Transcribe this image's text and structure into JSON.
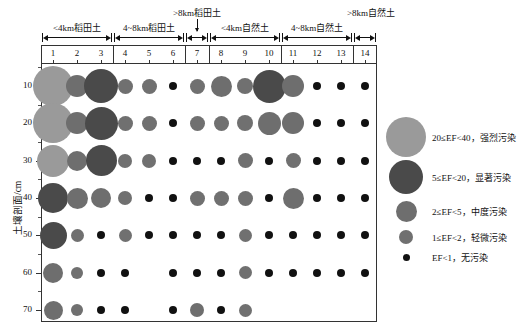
{
  "figure": {
    "y_axis_title": "土壤剖面/cm",
    "y_ticks": [
      "10",
      "20",
      "30",
      "40",
      "50",
      "60",
      "70"
    ],
    "column_numbers": [
      "1",
      "2",
      "3",
      "4",
      "5",
      "6",
      "7",
      "8",
      "9",
      "10",
      "11",
      "12",
      "13",
      "14"
    ],
    "groups": [
      {
        "label": "<4km稻田土",
        "from": 1,
        "to": 3
      },
      {
        "label": "4~8km稻田土",
        "from": 4,
        "to": 6
      },
      {
        "label": ">8km稻田土",
        "from": 7,
        "to": 7
      },
      {
        "label": "<4km自然土",
        "from": 8,
        "to": 10
      },
      {
        "label": "4~8km自然土",
        "from": 11,
        "to": 13
      },
      {
        "label": ">8km自然土",
        "from": 14,
        "to": 14
      }
    ]
  },
  "legend": {
    "items": [
      {
        "label": "20≤EF<40，强烈污染",
        "size": 40,
        "color": "#9a9a9a"
      },
      {
        "label": "5≤EF<20，显著污染",
        "size": 34,
        "color": "#4a4a4a"
      },
      {
        "label": "2≤EF<5，中度污染",
        "size": 21,
        "color": "#6e6e6e"
      },
      {
        "label": "1≤EF<2，轻微污染",
        "size": 14,
        "color": "#707070"
      },
      {
        "label": "EF<1，无污染",
        "size": 7,
        "color": "#111111"
      }
    ]
  },
  "chart_data": {
    "type": "scatter",
    "title": "",
    "xlabel": "",
    "ylabel": "土壤剖面/cm",
    "x": [
      1,
      2,
      3,
      4,
      5,
      6,
      7,
      8,
      9,
      10,
      11,
      12,
      13,
      14
    ],
    "y": [
      10,
      20,
      30,
      40,
      50,
      60,
      70
    ],
    "ylim": [
      5,
      75
    ],
    "grid": false,
    "legend_position": "right",
    "size_encoding": "bubble area = enrichment factor (EF) class",
    "classes": [
      {
        "name": "强烈污染",
        "range": "20≤EF<40",
        "size": 40,
        "color": "#9a9a9a"
      },
      {
        "name": "显著污染",
        "range": "5≤EF<20",
        "size": 34,
        "color": "#4a4a4a"
      },
      {
        "name": "中度污染",
        "range": "2≤EF<5",
        "size": 21,
        "color": "#6e6e6e"
      },
      {
        "name": "轻微污染",
        "range": "1≤EF<2",
        "size": 14,
        "color": "#707070"
      },
      {
        "name": "无污染",
        "range": "EF<1",
        "size": 7,
        "color": "#111111"
      }
    ],
    "points": [
      {
        "col": 1,
        "depth": 10,
        "size": 40,
        "color": "#9a9a9a",
        "class": "强烈污染"
      },
      {
        "col": 2,
        "depth": 10,
        "size": 22,
        "color": "#6e6e6e",
        "class": "中度污染"
      },
      {
        "col": 3,
        "depth": 10,
        "size": 34,
        "color": "#4a4a4a",
        "class": "显著污染"
      },
      {
        "col": 4,
        "depth": 10,
        "size": 15,
        "color": "#707070",
        "class": "轻微污染"
      },
      {
        "col": 5,
        "depth": 10,
        "size": 15,
        "color": "#707070",
        "class": "轻微污染"
      },
      {
        "col": 6,
        "depth": 10,
        "size": 8,
        "color": "#111111",
        "class": "无污染"
      },
      {
        "col": 7,
        "depth": 10,
        "size": 15,
        "color": "#707070",
        "class": "轻微污染"
      },
      {
        "col": 8,
        "depth": 10,
        "size": 21,
        "color": "#6e6e6e",
        "class": "中度污染"
      },
      {
        "col": 9,
        "depth": 10,
        "size": 16,
        "color": "#707070",
        "class": "轻微污染"
      },
      {
        "col": 10,
        "depth": 10,
        "size": 33,
        "color": "#4a4a4a",
        "class": "显著污染"
      },
      {
        "col": 11,
        "depth": 10,
        "size": 22,
        "color": "#6e6e6e",
        "class": "中度污染"
      },
      {
        "col": 12,
        "depth": 10,
        "size": 8,
        "color": "#111111",
        "class": "无污染"
      },
      {
        "col": 13,
        "depth": 10,
        "size": 8,
        "color": "#111111",
        "class": "无污染"
      },
      {
        "col": 14,
        "depth": 10,
        "size": 8,
        "color": "#111111",
        "class": "无污染"
      },
      {
        "col": 1,
        "depth": 20,
        "size": 40,
        "color": "#9a9a9a",
        "class": "强烈污染"
      },
      {
        "col": 2,
        "depth": 20,
        "size": 22,
        "color": "#6e6e6e",
        "class": "中度污染"
      },
      {
        "col": 3,
        "depth": 20,
        "size": 33,
        "color": "#4a4a4a",
        "class": "显著污染"
      },
      {
        "col": 4,
        "depth": 20,
        "size": 15,
        "color": "#707070",
        "class": "轻微污染"
      },
      {
        "col": 5,
        "depth": 20,
        "size": 15,
        "color": "#707070",
        "class": "轻微污染"
      },
      {
        "col": 6,
        "depth": 20,
        "size": 8,
        "color": "#111111",
        "class": "无污染"
      },
      {
        "col": 7,
        "depth": 20,
        "size": 15,
        "color": "#707070",
        "class": "轻微污染"
      },
      {
        "col": 8,
        "depth": 20,
        "size": 15,
        "color": "#707070",
        "class": "轻微污染"
      },
      {
        "col": 9,
        "depth": 20,
        "size": 16,
        "color": "#707070",
        "class": "轻微污染"
      },
      {
        "col": 10,
        "depth": 20,
        "size": 23,
        "color": "#6e6e6e",
        "class": "中度污染"
      },
      {
        "col": 11,
        "depth": 20,
        "size": 22,
        "color": "#6e6e6e",
        "class": "中度污染"
      },
      {
        "col": 12,
        "depth": 20,
        "size": 8,
        "color": "#111111",
        "class": "无污染"
      },
      {
        "col": 13,
        "depth": 20,
        "size": 8,
        "color": "#111111",
        "class": "无污染"
      },
      {
        "col": 14,
        "depth": 20,
        "size": 8,
        "color": "#111111",
        "class": "无污染"
      },
      {
        "col": 1,
        "depth": 30,
        "size": 32,
        "color": "#9a9a9a",
        "class": "强烈污染"
      },
      {
        "col": 2,
        "depth": 30,
        "size": 20,
        "color": "#6e6e6e",
        "class": "中度污染"
      },
      {
        "col": 3,
        "depth": 30,
        "size": 31,
        "color": "#4a4a4a",
        "class": "显著污染"
      },
      {
        "col": 4,
        "depth": 30,
        "size": 14,
        "color": "#707070",
        "class": "轻微污染"
      },
      {
        "col": 5,
        "depth": 30,
        "size": 14,
        "color": "#707070",
        "class": "轻微污染"
      },
      {
        "col": 6,
        "depth": 30,
        "size": 8,
        "color": "#111111",
        "class": "无污染"
      },
      {
        "col": 7,
        "depth": 30,
        "size": 8,
        "color": "#111111",
        "class": "无污染"
      },
      {
        "col": 8,
        "depth": 30,
        "size": 8,
        "color": "#111111",
        "class": "无污染"
      },
      {
        "col": 9,
        "depth": 30,
        "size": 15,
        "color": "#707070",
        "class": "轻微污染"
      },
      {
        "col": 10,
        "depth": 30,
        "size": 8,
        "color": "#111111",
        "class": "无污染"
      },
      {
        "col": 11,
        "depth": 30,
        "size": 15,
        "color": "#707070",
        "class": "轻微污染"
      },
      {
        "col": 12,
        "depth": 30,
        "size": 8,
        "color": "#111111",
        "class": "无污染"
      },
      {
        "col": 13,
        "depth": 30,
        "size": 8,
        "color": "#111111",
        "class": "无污染"
      },
      {
        "col": 14,
        "depth": 30,
        "size": 8,
        "color": "#111111",
        "class": "无污染"
      },
      {
        "col": 1,
        "depth": 40,
        "size": 30,
        "color": "#4a4a4a",
        "class": "显著污染"
      },
      {
        "col": 2,
        "depth": 40,
        "size": 21,
        "color": "#6e6e6e",
        "class": "中度污染"
      },
      {
        "col": 3,
        "depth": 40,
        "size": 20,
        "color": "#6e6e6e",
        "class": "中度污染"
      },
      {
        "col": 4,
        "depth": 40,
        "size": 14,
        "color": "#707070",
        "class": "轻微污染"
      },
      {
        "col": 5,
        "depth": 40,
        "size": 8,
        "color": "#111111",
        "class": "无污染"
      },
      {
        "col": 6,
        "depth": 40,
        "size": 8,
        "color": "#111111",
        "class": "无污染"
      },
      {
        "col": 7,
        "depth": 40,
        "size": 15,
        "color": "#707070",
        "class": "轻微污染"
      },
      {
        "col": 8,
        "depth": 40,
        "size": 15,
        "color": "#707070",
        "class": "轻微污染"
      },
      {
        "col": 9,
        "depth": 40,
        "size": 15,
        "color": "#707070",
        "class": "轻微污染"
      },
      {
        "col": 10,
        "depth": 40,
        "size": 8,
        "color": "#111111",
        "class": "无污染"
      },
      {
        "col": 11,
        "depth": 40,
        "size": 21,
        "color": "#6e6e6e",
        "class": "中度污染"
      },
      {
        "col": 12,
        "depth": 40,
        "size": 8,
        "color": "#111111",
        "class": "无污染"
      },
      {
        "col": 13,
        "depth": 40,
        "size": 8,
        "color": "#111111",
        "class": "无污染"
      },
      {
        "col": 14,
        "depth": 40,
        "size": 8,
        "color": "#111111",
        "class": "无污染"
      },
      {
        "col": 1,
        "depth": 50,
        "size": 27,
        "color": "#4a4a4a",
        "class": "显著污染"
      },
      {
        "col": 2,
        "depth": 50,
        "size": 13,
        "color": "#707070",
        "class": "轻微污染"
      },
      {
        "col": 3,
        "depth": 50,
        "size": 8,
        "color": "#111111",
        "class": "无污染"
      },
      {
        "col": 4,
        "depth": 50,
        "size": 13,
        "color": "#707070",
        "class": "轻微污染"
      },
      {
        "col": 5,
        "depth": 50,
        "size": 8,
        "color": "#111111",
        "class": "无污染"
      },
      {
        "col": 6,
        "depth": 50,
        "size": 8,
        "color": "#111111",
        "class": "无污染"
      },
      {
        "col": 7,
        "depth": 50,
        "size": 8,
        "color": "#111111",
        "class": "无污染"
      },
      {
        "col": 8,
        "depth": 50,
        "size": 8,
        "color": "#111111",
        "class": "无污染"
      },
      {
        "col": 9,
        "depth": 50,
        "size": 13,
        "color": "#707070",
        "class": "轻微污染"
      },
      {
        "col": 10,
        "depth": 50,
        "size": 8,
        "color": "#111111",
        "class": "无污染"
      },
      {
        "col": 11,
        "depth": 50,
        "size": 8,
        "color": "#111111",
        "class": "无污染"
      },
      {
        "col": 12,
        "depth": 50,
        "size": 8,
        "color": "#111111",
        "class": "无污染"
      },
      {
        "col": 13,
        "depth": 50,
        "size": 8,
        "color": "#111111",
        "class": "无污染"
      },
      {
        "col": 14,
        "depth": 50,
        "size": 8,
        "color": "#111111",
        "class": "无污染"
      },
      {
        "col": 1,
        "depth": 60,
        "size": 20,
        "color": "#6e6e6e",
        "class": "中度污染"
      },
      {
        "col": 2,
        "depth": 60,
        "size": 12,
        "color": "#707070",
        "class": "轻微污染"
      },
      {
        "col": 3,
        "depth": 60,
        "size": 8,
        "color": "#111111",
        "class": "无污染"
      },
      {
        "col": 4,
        "depth": 60,
        "size": 8,
        "color": "#111111",
        "class": "无污染"
      },
      {
        "col": 6,
        "depth": 60,
        "size": 8,
        "color": "#111111",
        "class": "无污染"
      },
      {
        "col": 7,
        "depth": 60,
        "size": 8,
        "color": "#111111",
        "class": "无污染"
      },
      {
        "col": 8,
        "depth": 60,
        "size": 8,
        "color": "#111111",
        "class": "无污染"
      },
      {
        "col": 9,
        "depth": 60,
        "size": 13,
        "color": "#707070",
        "class": "轻微污染"
      },
      {
        "col": 10,
        "depth": 60,
        "size": 8,
        "color": "#111111",
        "class": "无污染"
      },
      {
        "col": 11,
        "depth": 60,
        "size": 8,
        "color": "#111111",
        "class": "无污染"
      },
      {
        "col": 12,
        "depth": 60,
        "size": 8,
        "color": "#111111",
        "class": "无污染"
      },
      {
        "col": 13,
        "depth": 60,
        "size": 8,
        "color": "#111111",
        "class": "无污染"
      },
      {
        "col": 14,
        "depth": 60,
        "size": 8,
        "color": "#111111",
        "class": "无污染"
      },
      {
        "col": 1,
        "depth": 70,
        "size": 19,
        "color": "#6e6e6e",
        "class": "中度污染"
      },
      {
        "col": 2,
        "depth": 70,
        "size": 12,
        "color": "#707070",
        "class": "轻微污染"
      },
      {
        "col": 3,
        "depth": 70,
        "size": 8,
        "color": "#111111",
        "class": "无污染"
      },
      {
        "col": 4,
        "depth": 70,
        "size": 8,
        "color": "#111111",
        "class": "无污染"
      },
      {
        "col": 6,
        "depth": 70,
        "size": 8,
        "color": "#111111",
        "class": "无污染"
      },
      {
        "col": 7,
        "depth": 70,
        "size": 14,
        "color": "#6e6e6e",
        "class": "中度污染"
      },
      {
        "col": 8,
        "depth": 70,
        "size": 8,
        "color": "#111111",
        "class": "无污染"
      },
      {
        "col": 9,
        "depth": 70,
        "size": 13,
        "color": "#707070",
        "class": "轻微污染"
      }
    ]
  }
}
